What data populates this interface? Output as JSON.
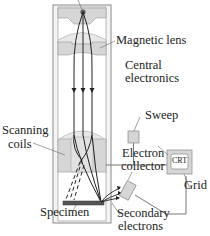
{
  "diagram": {
    "labels": {
      "magnetic_lens": "Magnetic lens",
      "central_electronics_line1": "Central",
      "central_electronics_line2": "electronics",
      "sweep": "Sweep",
      "crt": "CRT",
      "scanning_coils_line1": "Scanning",
      "scanning_coils_line2": "coils",
      "electron_collector_line1": "Electron",
      "electron_collector_line2": "collector",
      "grid": "Grid",
      "specimen": "Specimen",
      "secondary_electrons_line1": "Secondary",
      "secondary_electrons_line2": "electrons"
    },
    "colors": {
      "housing_fill": "#d6d6d6",
      "column_outline": "#8a8a8a",
      "beam": "#222222",
      "specimen": "#555555",
      "wire": "#777777"
    }
  }
}
